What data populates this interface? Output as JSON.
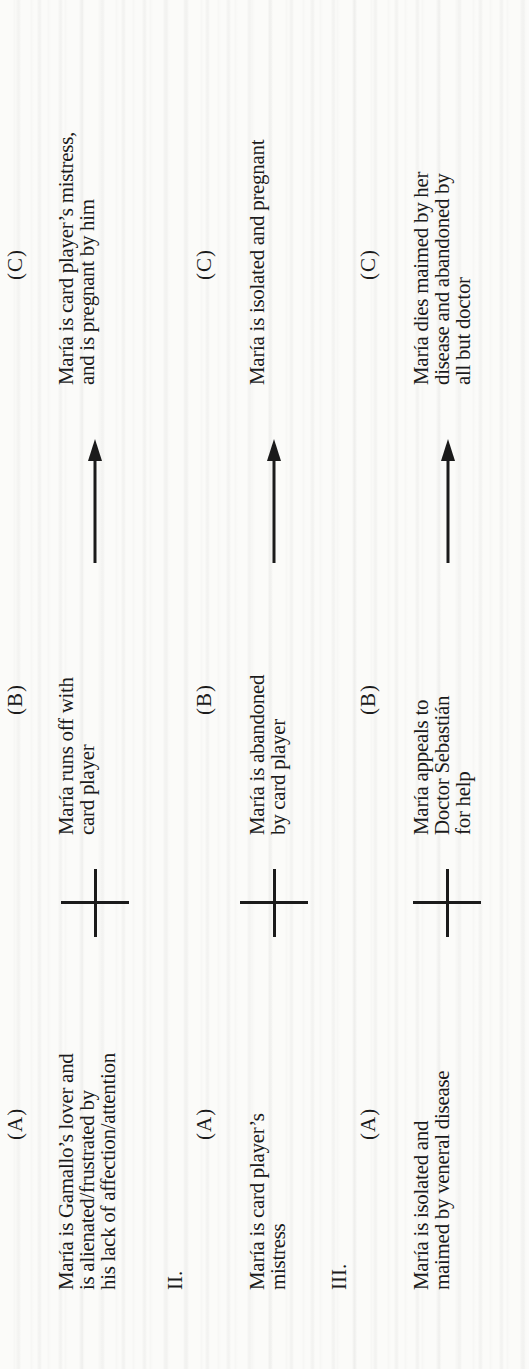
{
  "document": {
    "orientation": "rotated 90 degrees counter-clockwise",
    "columns": [
      "(A)",
      "(B)",
      "(C)"
    ],
    "rows": [
      {
        "numeral": "",
        "a_label": "(A)",
        "a_text": "María is Gamallo’s lover and\nis alienated/frustrated by\nhis lack of affection/attention",
        "connector_ab": "plus-icon",
        "b_label": "(B)",
        "b_text": "María runs off with\ncard player",
        "connector_bc": "arrow-icon",
        "c_label": "(C)",
        "c_text": "María is card player’s mistress,\nand is pregnant by him"
      },
      {
        "numeral": "II.",
        "a_label": "(A)",
        "a_text": "María is card player’s\nmistress",
        "connector_ab": "plus-icon",
        "b_label": "(B)",
        "b_text": "María is abandoned\nby card player",
        "connector_bc": "arrow-icon",
        "c_label": "(C)",
        "c_text": "María is isolated and pregnant"
      },
      {
        "numeral": "III.",
        "a_label": "(A)",
        "a_text": "María is isolated and\nmaimed by veneral disease",
        "connector_ab": "plus-icon",
        "b_label": "(B)",
        "b_text": "María appeals to\nDoctor Sebastián\nfor help",
        "connector_bc": "arrow-icon",
        "c_label": "(C)",
        "c_text": "María dies maimed by her\ndisease and abandoned by\nall but doctor"
      }
    ]
  },
  "colors": {
    "ink": "#1b1b1b",
    "paper": "#fbfbf9"
  }
}
